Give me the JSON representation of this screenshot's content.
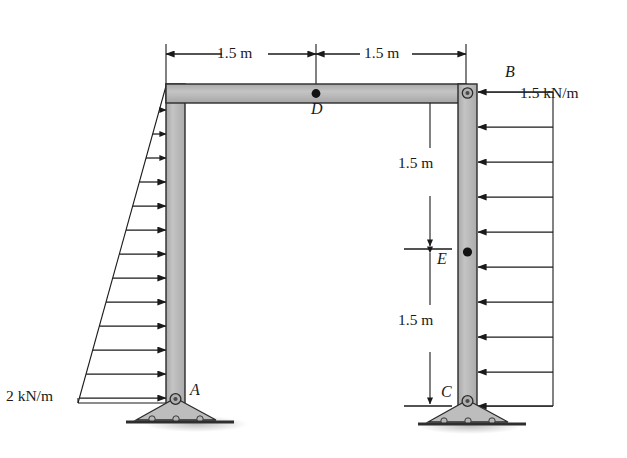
{
  "figure": {
    "type": "structural-frame-diagram",
    "colors": {
      "member_fill": "#b9b9b9",
      "member_edge": "#2b2b2b",
      "line": "#1a1a1a",
      "ground": "#333333",
      "shadow": "#cccccc",
      "background": "#ffffff"
    }
  },
  "dimensions": {
    "top_left_span": "1.5 m",
    "top_right_span": "1.5 m",
    "right_upper_segment": "1.5 m",
    "right_lower_segment": "1.5 m"
  },
  "joints": {
    "a": "A",
    "b": "B",
    "c": "C",
    "d": "D",
    "e": "E"
  },
  "loads": {
    "left_label": "2 kN/m",
    "left_type": "triangular",
    "left_peak_value": 2,
    "left_peak_units": "kN/m",
    "left_direction": "right",
    "left_arrow_count": 13,
    "right_label": "1.5 kN/m",
    "right_type": "uniform",
    "right_value": 1.5,
    "right_units": "kN/m",
    "right_direction": "left",
    "right_arrow_count": 10
  },
  "supports": {
    "a_type": "pin",
    "c_type": "pin"
  }
}
